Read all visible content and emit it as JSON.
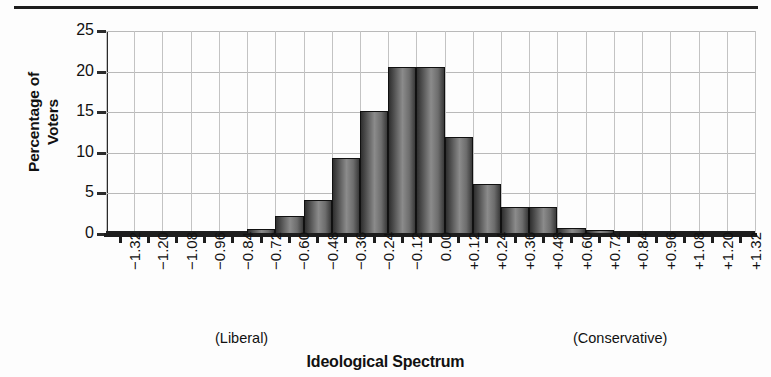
{
  "chart_data": {
    "type": "bar",
    "title": "",
    "xlabel": "Ideological Spectrum",
    "ylabel": "Percentage of Voters",
    "ylabel_lines": [
      "Percentage of",
      "Voters"
    ],
    "categories": [
      "−1.32",
      "−1.20",
      "−1.08",
      "−0.96",
      "−0.84",
      "−0.72",
      "−0.60",
      "−0.48",
      "−0.36",
      "−0.24",
      "−0.12",
      "0.00",
      "+0.12",
      "+0.24",
      "+0.36",
      "+0.48",
      "+0.60",
      "+0.72",
      "+0.84",
      "+0.96",
      "+1.08",
      "+1.20",
      "+1.32"
    ],
    "values": [
      0.3,
      0.2,
      0.2,
      0.1,
      0.2,
      0.6,
      2.2,
      4.2,
      9.3,
      15.2,
      20.6,
      20.6,
      11.9,
      6.2,
      3.3,
      3.3,
      0.7,
      0.5,
      0.1,
      0.1,
      0.2,
      0.2,
      0.2
    ],
    "ylim": [
      0,
      25
    ],
    "yticks": [
      0,
      5,
      10,
      15,
      20,
      25
    ],
    "ytick_labels": [
      "0",
      "5",
      "10",
      "15",
      "20",
      "25"
    ],
    "grid": true,
    "legend": false,
    "annotations": [
      {
        "name": "liberal-anchor",
        "text": "(Liberal)"
      },
      {
        "name": "conservative-anchor",
        "text": "(Conservative)"
      }
    ],
    "bar_color": "#6d6d6d",
    "bar_edge_color": "#111111",
    "grid_color": "#b9b9b9",
    "axis_color": "#1d1d1d"
  }
}
